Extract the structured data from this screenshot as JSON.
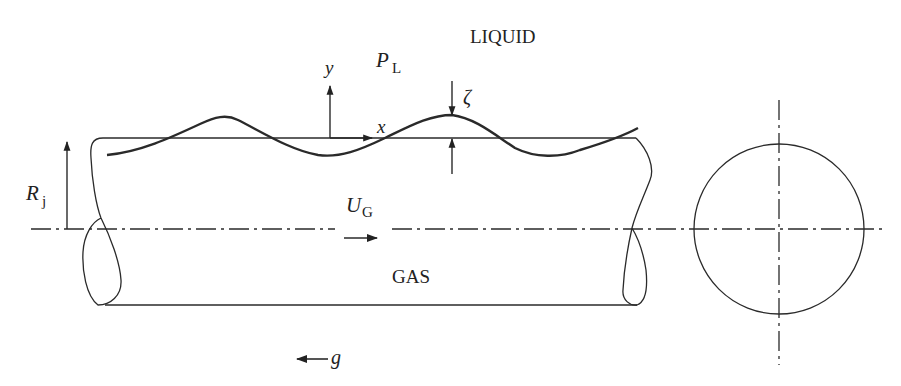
{
  "diagram": {
    "labels": {
      "liquid": "LIQUID",
      "gas": "GAS",
      "pressure_symbol": "P",
      "pressure_subscript": "L",
      "y_axis": "y",
      "x_axis": "x",
      "amplitude": "ζ",
      "radius_symbol": "R",
      "radius_subscript": "j",
      "velocity_symbol": "U",
      "velocity_subscript": "G",
      "gravity": "g"
    },
    "elements": [
      {
        "id": "tube-body",
        "kind": "cylinder side view",
        "from_x": 100,
        "to_x": 635,
        "top_y": 138,
        "bottom_y": 305
      },
      {
        "id": "wave",
        "kind": "sinusoidal interface",
        "amplitude_label": "ζ"
      },
      {
        "id": "centerline",
        "kind": "dash-dot axis",
        "y": 229
      },
      {
        "id": "cross-section",
        "kind": "circle",
        "cx": 779,
        "cy": 229,
        "r": 85
      },
      {
        "id": "gravity-arrow",
        "direction": "left"
      },
      {
        "id": "gas-velocity-arrow",
        "direction": "right"
      }
    ]
  }
}
